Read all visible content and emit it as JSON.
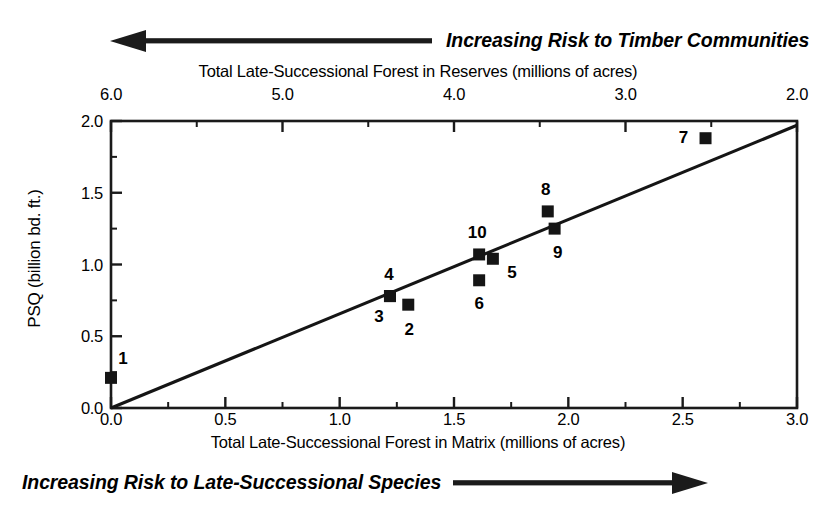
{
  "annotations": {
    "top": "Increasing Risk to Timber Communities",
    "bottom": "Increasing Risk to Late-Successional Species",
    "top_arrow_icon": "arrow-left-icon",
    "bottom_arrow_icon": "arrow-right-icon"
  },
  "chart_data": {
    "type": "scatter",
    "title": "",
    "xlabel": "Total Late-Successional Forest in Matrix (millions of acres)",
    "ylabel": "PSQ (billion bd. ft.)",
    "x2label": "Total Late-Successional Forest in Reserves (millions of acres)",
    "xlim": [
      0.0,
      3.0
    ],
    "ylim": [
      0.0,
      2.0
    ],
    "x2lim": [
      6.0,
      2.0
    ],
    "grid": false,
    "legend": "none",
    "xticks": [
      "0.0",
      "0.5",
      "1.0",
      "1.5",
      "2.0",
      "2.5",
      "3.0"
    ],
    "xtick_values": [
      0.0,
      0.5,
      1.0,
      1.5,
      2.0,
      2.5,
      3.0
    ],
    "x_minor_step": 0.25,
    "yticks": [
      "0.0",
      "0.5",
      "1.0",
      "1.5",
      "2.0"
    ],
    "ytick_values": [
      0.0,
      0.5,
      1.0,
      1.5,
      2.0
    ],
    "y_minor_step": 0.25,
    "x2ticks": [
      "6.0",
      "5.0",
      "4.0",
      "3.0",
      "2.0"
    ],
    "x2tick_values": [
      6.0,
      5.0,
      4.0,
      3.0,
      2.0
    ],
    "x2_minor_step": 0.5,
    "points": [
      {
        "label": "1",
        "x": 0.0,
        "y": 0.21,
        "label_dx": 12,
        "label_dy": -20
      },
      {
        "label": "2",
        "x": 1.3,
        "y": 0.72,
        "label_dx": 1,
        "label_dy": 24
      },
      {
        "label": "3",
        "x": 1.22,
        "y": 0.78,
        "label_dx": -11,
        "label_dy": 20
      },
      {
        "label": "4",
        "x": 1.22,
        "y": 0.78,
        "label_dx": -1,
        "label_dy": -22
      },
      {
        "label": "5",
        "x": 1.67,
        "y": 1.04,
        "label_dx": 19,
        "label_dy": 13
      },
      {
        "label": "6",
        "x": 1.61,
        "y": 0.89,
        "label_dx": 0,
        "label_dy": 23
      },
      {
        "label": "7",
        "x": 2.6,
        "y": 1.88,
        "label_dx": -22,
        "label_dy": -1
      },
      {
        "label": "8",
        "x": 1.91,
        "y": 1.37,
        "label_dx": -2,
        "label_dy": -22
      },
      {
        "label": "9",
        "x": 1.94,
        "y": 1.25,
        "label_dx": 3,
        "label_dy": 23
      },
      {
        "label": "10",
        "x": 1.61,
        "y": 1.07,
        "label_dx": -2,
        "label_dy": -22
      }
    ],
    "trendline": {
      "x0": 0.0,
      "y0": 0.0,
      "x1": 3.0,
      "y1": 1.97
    },
    "marker": "filled-square",
    "marker_color": "#151515",
    "line_color": "#151515",
    "axis_color": "#1a1a1a"
  }
}
